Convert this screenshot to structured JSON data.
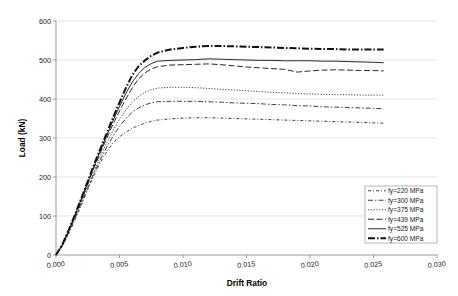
{
  "chart_data": {
    "type": "line",
    "title": "",
    "xlabel": "Drift Ratio",
    "ylabel": "Load (kN)",
    "xlim": [
      0.0,
      0.03
    ],
    "ylim": [
      0,
      600
    ],
    "grid": "horizontal",
    "legend_position": "bottom-right",
    "xticks": [
      "0.000",
      "0.005",
      "0.010",
      "0.015",
      "0.020",
      "0.025",
      "0.030"
    ],
    "xtick_values": [
      0.0,
      0.005,
      0.01,
      0.015,
      0.02,
      0.025,
      0.03
    ],
    "yticks": [
      "0",
      "100",
      "200",
      "300",
      "400",
      "500",
      "600"
    ],
    "ytick_values": [
      0,
      100,
      200,
      300,
      400,
      500,
      600
    ],
    "x": [
      0.0,
      0.0005,
      0.001,
      0.0015,
      0.002,
      0.0025,
      0.003,
      0.0035,
      0.004,
      0.0045,
      0.005,
      0.0055,
      0.006,
      0.0065,
      0.007,
      0.0075,
      0.008,
      0.009,
      0.01,
      0.011,
      0.012,
      0.013,
      0.014,
      0.015,
      0.016,
      0.017,
      0.018,
      0.019,
      0.02,
      0.021,
      0.022,
      0.023,
      0.024,
      0.025,
      0.0258
    ],
    "series": [
      {
        "name": "fy=220 MPa",
        "label": "fy=220 MPa",
        "dash": "3,2,1,2",
        "width": 0.8,
        "values": [
          0,
          22,
          55,
          90,
          128,
          168,
          205,
          238,
          265,
          288,
          303,
          315,
          325,
          332,
          338,
          343,
          346,
          349,
          351,
          352,
          352,
          351,
          350,
          349,
          348,
          347,
          346,
          345,
          344,
          343,
          342,
          341,
          340,
          339,
          338
        ]
      },
      {
        "name": "fy=300 MPa",
        "label": "fy=300 MPa",
        "dash": "5,2,1.5,2",
        "width": 0.8,
        "values": [
          0,
          24,
          58,
          95,
          133,
          172,
          210,
          245,
          277,
          305,
          330,
          350,
          366,
          377,
          385,
          390,
          393,
          394,
          394,
          394,
          393,
          392,
          390,
          389,
          388,
          386,
          385,
          383,
          382,
          380,
          379,
          378,
          377,
          376,
          375
        ]
      },
      {
        "name": "fy=375 MPa",
        "label": "fy=375 MPa",
        "dash": "1.2,1.6",
        "width": 0.8,
        "values": [
          0,
          25,
          60,
          98,
          138,
          178,
          216,
          253,
          288,
          320,
          348,
          372,
          392,
          406,
          417,
          424,
          428,
          430,
          430,
          429,
          427,
          425,
          423,
          421,
          419,
          417,
          416,
          414,
          413,
          412,
          411,
          411,
          410,
          410,
          410
        ]
      },
      {
        "name": "fy=439 MPa",
        "label": "fy=439 MPa",
        "dash": "6,2.5",
        "width": 0.9,
        "values": [
          0,
          26,
          62,
          101,
          142,
          184,
          224,
          263,
          300,
          336,
          369,
          400,
          428,
          452,
          467,
          477,
          483,
          487,
          488,
          489,
          490,
          488,
          485,
          482,
          480,
          478,
          476,
          469,
          472,
          474,
          475,
          474,
          473,
          473,
          472
        ]
      },
      {
        "name": "fy=525 MPa",
        "label": "fy=525 MPa",
        "dash": "0",
        "width": 0.9,
        "values": [
          0,
          26,
          63,
          103,
          144,
          187,
          228,
          268,
          307,
          345,
          381,
          414,
          443,
          465,
          481,
          491,
          497,
          499,
          500,
          501,
          503,
          502,
          501,
          500,
          499,
          499,
          498,
          498,
          498,
          497,
          497,
          496,
          495,
          494,
          493
        ]
      },
      {
        "name": "fy=600 MPa",
        "label": "fy=600 MPa",
        "dash": "7,2,1.5,2",
        "width": 2.0,
        "values": [
          0,
          27,
          64,
          104,
          146,
          189,
          232,
          273,
          313,
          353,
          391,
          428,
          461,
          484,
          499,
          511,
          519,
          527,
          531,
          534,
          536,
          536,
          535,
          534,
          533,
          532,
          531,
          530,
          529,
          528,
          528,
          527,
          527,
          527,
          527
        ]
      }
    ]
  },
  "plot_geometry": {
    "left": 56,
    "right": 437,
    "top": 21,
    "bottom": 255
  },
  "legend": {
    "x": 365,
    "y": 186,
    "width": 72,
    "height": 57
  }
}
